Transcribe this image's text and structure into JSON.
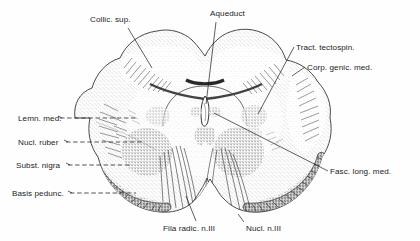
{
  "figure": {
    "background_color": "#fefefe",
    "ink_color": "#1b1b1b",
    "width": 420,
    "height": 241
  },
  "labels": [
    {
      "id": "collic-sup",
      "text": "Collic. sup.",
      "x": 90,
      "y": 16,
      "align": "left"
    },
    {
      "id": "aqueduct",
      "text": "Aqueduct",
      "x": 210,
      "y": 10,
      "align": "left"
    },
    {
      "id": "tract-tectospin",
      "text": "Tract. tectospin.",
      "x": 296,
      "y": 44,
      "align": "left"
    },
    {
      "id": "corp-genic-med",
      "text": "Corp. genic. med.",
      "x": 307,
      "y": 64,
      "align": "left"
    },
    {
      "id": "lemn-med",
      "text": "Lemn. med.",
      "x": 18,
      "y": 115,
      "align": "left"
    },
    {
      "id": "nucl-ruber",
      "text": "Nucl. ruber",
      "x": 18,
      "y": 139,
      "align": "left"
    },
    {
      "id": "subst-nigra",
      "text": "Subst. nigra",
      "x": 16,
      "y": 162,
      "align": "left"
    },
    {
      "id": "basis-pedunc",
      "text": "Basis pedunc.",
      "x": 12,
      "y": 190,
      "align": "left"
    },
    {
      "id": "fasc-long-med",
      "text": "Fasc. long. med.",
      "x": 330,
      "y": 168,
      "align": "left"
    },
    {
      "id": "fila-radic",
      "text": "Fila radic. n.III",
      "x": 163,
      "y": 225,
      "align": "left"
    },
    {
      "id": "nucl-n3",
      "text": "Nucl. n.III",
      "x": 246,
      "y": 225,
      "align": "left"
    }
  ],
  "structures": {
    "colliculus_superior": "Collic. sup.",
    "cerebral_aqueduct": "Aqueduct",
    "tectospinal_tract": "Tract. tectospin.",
    "medial_geniculate_body": "Corp. genic. med.",
    "medial_lemniscus": "Lemn. med.",
    "red_nucleus": "Nucl. ruber",
    "substantia_nigra": "Subst. nigra",
    "basis_pedunculi": "Basis pedunc.",
    "medial_longitudinal_fasciculus": "Fasc. long. med.",
    "oculomotor_rootlets": "Fila radic. n.III",
    "oculomotor_nucleus": "Nucl. n.III"
  }
}
